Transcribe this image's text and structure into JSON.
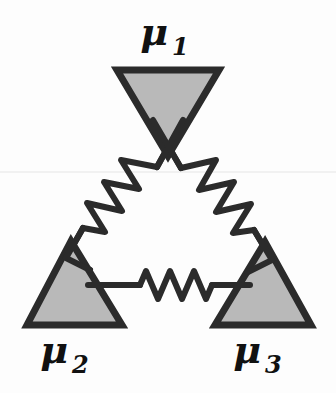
{
  "figure": {
    "background_color": "#fdfdfd",
    "stroke_color": "#2b2b2b",
    "fill_color": "#b9b9b9",
    "label_color": "#111111",
    "artifact_color": "#e8e8e8"
  },
  "nodes": [
    {
      "id": "node-1",
      "label": "μ",
      "subscript": "1",
      "label_full": "μ₁",
      "orientation": "down",
      "label_x": 168,
      "label_y": 45,
      "sub_x": 186,
      "sub_y": 54,
      "label_size": 38,
      "sub_size": 24,
      "points": "117,70 219,70 168,156",
      "cx": 168,
      "cy": 99
    },
    {
      "id": "node-2",
      "label": "μ",
      "subscript": "2",
      "label_full": "μ₂",
      "orientation": "up",
      "label_x": 62,
      "label_y": 363,
      "sub_x": 80,
      "sub_y": 372,
      "label_size": 38,
      "sub_size": 24,
      "points": "71,241 27,325 122,325",
      "cx": 73,
      "cy": 297
    },
    {
      "id": "node-3",
      "label": "μ",
      "subscript": "3",
      "label_full": "μ₃",
      "orientation": "up",
      "label_x": 252,
      "label_y": 363,
      "sub_x": 270,
      "sub_y": 372,
      "label_size": 38,
      "sub_size": 24,
      "points": "265,242 215,325 311,325",
      "cx": 263,
      "cy": 298
    }
  ],
  "springs": [
    {
      "id": "spring-left",
      "connects": [
        "node-1",
        "node-2"
      ],
      "orientation": "diagonal-left",
      "coils": 6,
      "lead_in": "183,120 157,167",
      "zigzag": "157,167 121,160 139,189 104,182 122,211 87,203 105,232 83,228",
      "lead_out": "83,228 66,258"
    },
    {
      "id": "spring-right",
      "connects": [
        "node-1",
        "node-3"
      ],
      "orientation": "diagonal-right",
      "coils": 6,
      "lead_in": "153,120 181,168",
      "zigzag": "181,168 216,160 199,190 234,182 216,212 251,204 233,233 254,230",
      "lead_out": "254,230 272,260"
    },
    {
      "id": "spring-bottom",
      "connects": [
        "node-2",
        "node-3"
      ],
      "orientation": "horizontal",
      "coils": 5,
      "lead_in": "88,285 140,285",
      "zigzag": "140,285 146,271 158,299 170,271 182,299 194,271 206,299 212,285",
      "lead_out": "212,285 250,285"
    }
  ],
  "connector_stubs": [
    {
      "id": "stub-node2-upper",
      "path": "66,258 90,270"
    },
    {
      "id": "stub-node3-upper",
      "path": "272,260 248,272"
    }
  ],
  "artifacts": [
    {
      "id": "scanline",
      "y": 172,
      "x1": 0,
      "x2": 336
    }
  ]
}
